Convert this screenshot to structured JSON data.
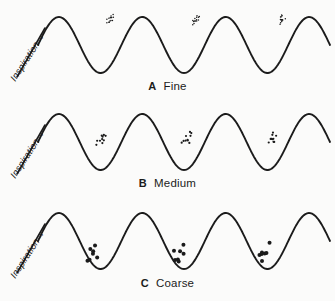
{
  "figure": {
    "background_color": "#fbfbfa",
    "ink_color": "#1b1b1b"
  },
  "panels": [
    {
      "id": "A",
      "letter": "A",
      "name": "Fine",
      "axis_label": "Inspiration",
      "axis_arrow": "arrow-up-right",
      "crackle": {
        "size": "fine",
        "dot_radius_px": 0.75,
        "dots_per_cluster": 14,
        "cluster_spread_px": 7,
        "position": "late-inspiration upper ascending limb",
        "clusters": 3
      }
    },
    {
      "id": "B",
      "letter": "B",
      "name": "Medium",
      "axis_label": "Inspiration",
      "axis_arrow": "arrow-up-right",
      "crackle": {
        "size": "medium",
        "dot_radius_px": 1.1,
        "dots_per_cluster": 10,
        "cluster_spread_px": 10,
        "position": "mid-inspiration ascending limb",
        "clusters": 3
      }
    },
    {
      "id": "C",
      "letter": "C",
      "name": "Coarse",
      "axis_label": "Inspiration",
      "axis_arrow": "arrow-up-right",
      "crackle": {
        "size": "coarse",
        "dot_radius_px": 2.0,
        "dots_per_cluster": 7,
        "cluster_spread_px": 14,
        "position": "early-inspiration trough and lower ascending limb",
        "clusters": 3
      }
    }
  ],
  "chart_data": {
    "type": "line",
    "xlabel": "",
    "ylabel": "Inspiration",
    "grid": false,
    "legend": "none",
    "series": [
      {
        "name": "A Fine",
        "waveform": "sinusoid",
        "cycles": 3.5,
        "amplitude": 28,
        "baseline_y": 45,
        "marker_x": [
          110,
          196,
          282
        ],
        "marker_y": [
          20,
          20,
          20
        ],
        "marker_label": "fine crackles"
      },
      {
        "name": "B Medium",
        "waveform": "sinusoid",
        "cycles": 3.5,
        "amplitude": 28,
        "baseline_y": 45,
        "marker_x": [
          101,
          187,
          273
        ],
        "marker_y": [
          42,
          42,
          42
        ],
        "marker_label": "medium crackles"
      },
      {
        "name": "C Coarse",
        "waveform": "sinusoid",
        "cycles": 3.5,
        "amplitude": 28,
        "baseline_y": 45,
        "marker_x": [
          92,
          178,
          264
        ],
        "marker_y": [
          58,
          58,
          58
        ],
        "marker_label": "coarse crackles"
      }
    ]
  }
}
